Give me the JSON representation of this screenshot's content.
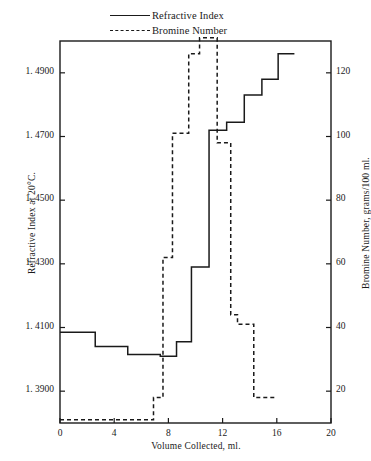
{
  "legend": {
    "items": [
      {
        "label": "Refractive Index",
        "style": "solid",
        "key_name": "legend-key-solid"
      },
      {
        "label": "Bromine Number",
        "style": "dashed",
        "key_name": "legend-key-dashed"
      }
    ]
  },
  "chart_data": {
    "type": "line",
    "title": "",
    "xlabel": "Volume Collected, ml.",
    "ylabel": "Refractive Index at 20°C.",
    "ylabel_right": "Bromine Number, grams/100 ml.",
    "xlim": [
      0,
      20
    ],
    "ylim": [
      1.38,
      1.5
    ],
    "ylim_right": [
      10,
      130
    ],
    "grid": false,
    "legend_position": "above-plot-center",
    "xticks": [
      0,
      4,
      8,
      12,
      16,
      20
    ],
    "xticklabels": [
      "0",
      "4",
      "8",
      "12",
      "16",
      "20"
    ],
    "yticks": [
      1.39,
      1.41,
      1.43,
      1.45,
      1.47,
      1.49
    ],
    "yticklabels": [
      "1. 3900",
      "1. 4100",
      "1. 4300",
      "1. 4500",
      "1. 4700",
      "1. 4900"
    ],
    "yticks_right": [
      20,
      40,
      60,
      80,
      100,
      120
    ],
    "yticklabels_right": [
      "20",
      "40",
      "60",
      "80",
      "100",
      "120"
    ],
    "series": [
      {
        "name": "Refractive Index",
        "style": "solid",
        "axis": "left",
        "drawing": "step-post",
        "steps": [
          {
            "x0": 0.0,
            "x1": 2.6,
            "y": 1.4085
          },
          {
            "x0": 2.6,
            "x1": 5.0,
            "y": 1.404
          },
          {
            "x0": 5.0,
            "x1": 7.4,
            "y": 1.4015
          },
          {
            "x0": 7.4,
            "x1": 8.6,
            "y": 1.401
          },
          {
            "x0": 8.6,
            "x1": 9.7,
            "y": 1.4055
          },
          {
            "x0": 9.7,
            "x1": 11.0,
            "y": 1.429
          },
          {
            "x0": 11.0,
            "x1": 12.3,
            "y": 1.472
          },
          {
            "x0": 12.3,
            "x1": 13.6,
            "y": 1.4745
          },
          {
            "x0": 13.6,
            "x1": 14.9,
            "y": 1.483
          },
          {
            "x0": 14.9,
            "x1": 16.1,
            "y": 1.488
          },
          {
            "x0": 16.1,
            "x1": 17.3,
            "y": 1.496
          }
        ]
      },
      {
        "name": "Bromine Number",
        "style": "dashed",
        "axis": "right",
        "drawing": "step-post",
        "steps": [
          {
            "x0": 0.0,
            "x1": 3.4,
            "y": 11
          },
          {
            "x0": 3.4,
            "x1": 6.9,
            "y": 11
          },
          {
            "x0": 6.9,
            "x1": 7.6,
            "y": 18
          },
          {
            "x0": 7.6,
            "x1": 8.3,
            "y": 62
          },
          {
            "x0": 8.3,
            "x1": 9.5,
            "y": 101
          },
          {
            "x0": 9.5,
            "x1": 10.3,
            "y": 126
          },
          {
            "x0": 10.3,
            "x1": 11.6,
            "y": 131
          },
          {
            "x0": 11.6,
            "x1": 12.6,
            "y": 98
          },
          {
            "x0": 12.6,
            "x1": 13.1,
            "y": 44
          },
          {
            "x0": 13.1,
            "x1": 14.3,
            "y": 41
          },
          {
            "x0": 14.3,
            "x1": 16.0,
            "y": 18
          }
        ]
      }
    ]
  }
}
